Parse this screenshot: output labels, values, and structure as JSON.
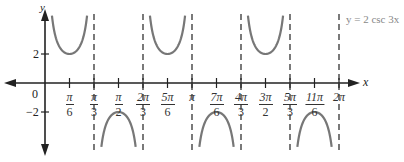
{
  "chart_data": {
    "type": "line",
    "title": "",
    "function": "y = 2 csc 3x",
    "legend": {
      "label": "y = 2 csc 3x",
      "position": "top-right"
    },
    "xlabel": "x",
    "ylabel": "y",
    "xlim": [
      0,
      6.2832
    ],
    "ylim": [
      -5,
      5
    ],
    "grid": false,
    "x_tick_labels": [
      {
        "num": "π",
        "den": "6",
        "value": 0.5236
      },
      {
        "num": "π",
        "den": "3",
        "value": 1.0472
      },
      {
        "num": "π",
        "den": "2",
        "value": 1.5708
      },
      {
        "num": "2π",
        "den": "3",
        "value": 2.0944
      },
      {
        "num": "5π",
        "den": "6",
        "value": 2.618
      },
      {
        "num": "π",
        "den": "",
        "value": 3.1416
      },
      {
        "num": "7π",
        "den": "6",
        "value": 3.6652
      },
      {
        "num": "4π",
        "den": "3",
        "value": 4.1888
      },
      {
        "num": "3π",
        "den": "2",
        "value": 4.7124
      },
      {
        "num": "5π",
        "den": "3",
        "value": 5.236
      },
      {
        "num": "11π",
        "den": "6",
        "value": 5.7596
      },
      {
        "num": "2π",
        "den": "",
        "value": 6.2832
      }
    ],
    "y_tick_labels": [
      {
        "label": "2",
        "value": 2
      },
      {
        "label": "−2",
        "value": -2
      }
    ],
    "origin_label": "0",
    "asymptotes": [
      "π/3",
      "2π/3",
      "π",
      "4π/3",
      "5π/3",
      "2π"
    ],
    "branches": [
      {
        "interval": [
          "0",
          "π/3"
        ],
        "vertex": [
          "π/6",
          2
        ],
        "opens": "up"
      },
      {
        "interval": [
          "π/3",
          "2π/3"
        ],
        "vertex": [
          "π/2",
          -2
        ],
        "opens": "down"
      },
      {
        "interval": [
          "2π/3",
          "π"
        ],
        "vertex": [
          "5π/6",
          2
        ],
        "opens": "up"
      },
      {
        "interval": [
          "π",
          "4π/3"
        ],
        "vertex": [
          "7π/6",
          -2
        ],
        "opens": "down"
      },
      {
        "interval": [
          "4π/3",
          "5π/3"
        ],
        "vertex": [
          "3π/2",
          2
        ],
        "opens": "up"
      },
      {
        "interval": [
          "5π/3",
          "2π"
        ],
        "vertex": [
          "11π/6",
          -2
        ],
        "opens": "down"
      }
    ],
    "colors": {
      "curve": "#777777",
      "axes": "#222222",
      "asymptote": "#222222"
    }
  }
}
